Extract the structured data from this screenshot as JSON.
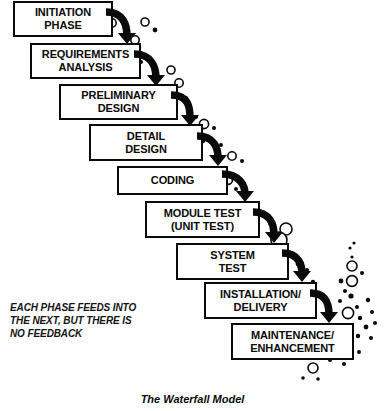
{
  "diagram": {
    "title": "The Waterfall Model",
    "caption": [
      "EACH PHASE FEEDS INTO",
      "THE NEXT, BUT THERE IS",
      "NO FEEDBACK"
    ],
    "ink_color": "#0a0a0a",
    "background_color": "#ffffff",
    "phases": [
      {
        "id": "initiation",
        "lines": [
          "INITIATION",
          "PHASE"
        ],
        "x": 13,
        "y": 1,
        "w": 100,
        "h": 36
      },
      {
        "id": "requirements",
        "lines": [
          "REQUIREMENTS",
          "ANALYSIS"
        ],
        "x": 30,
        "y": 43,
        "w": 111,
        "h": 36
      },
      {
        "id": "preliminary",
        "lines": [
          "PRELIMINARY",
          "DESIGN"
        ],
        "x": 59,
        "y": 84,
        "w": 119,
        "h": 36
      },
      {
        "id": "detail",
        "lines": [
          "DETAIL",
          "DESIGN"
        ],
        "x": 89,
        "y": 124,
        "w": 114,
        "h": 37
      },
      {
        "id": "coding",
        "lines": [
          "CODING"
        ],
        "x": 117,
        "y": 166,
        "w": 111,
        "h": 29
      },
      {
        "id": "module-test",
        "lines": [
          "MODULE TEST",
          "(UNIT TEST)"
        ],
        "x": 145,
        "y": 201,
        "w": 115,
        "h": 37
      },
      {
        "id": "system-test",
        "lines": [
          "SYSTEM",
          "TEST"
        ],
        "x": 176,
        "y": 243,
        "w": 113,
        "h": 37
      },
      {
        "id": "installation",
        "lines": [
          "INSTALLATION/",
          "DELIVERY"
        ],
        "x": 204,
        "y": 282,
        "w": 113,
        "h": 37
      },
      {
        "id": "maintenance",
        "lines": [
          "MAINTENANCE/",
          "ENHANCEMENT"
        ],
        "x": 231,
        "y": 323,
        "w": 123,
        "h": 37
      }
    ],
    "arrows": [
      {
        "id": "arrow-initiation-to-requirements",
        "path": "M 106 12 C 124 12 127 26 127 36",
        "tip_x": 127,
        "tip_y": 44
      },
      {
        "id": "arrow-requirements-to-preliminary",
        "path": "M 134 54 C 152 54 156 68 156 78",
        "tip_x": 156,
        "tip_y": 86
      },
      {
        "id": "arrow-preliminary-to-detail",
        "path": "M 171 95 C 189 95 190 108 190 118",
        "tip_x": 190,
        "tip_y": 126
      },
      {
        "id": "arrow-detail-to-coding",
        "path": "M 197 136 C 215 136 218 149 218 158",
        "tip_x": 218,
        "tip_y": 166
      },
      {
        "id": "arrow-coding-to-module-test",
        "path": "M 222 174 C 240 174 245 186 245 194",
        "tip_x": 245,
        "tip_y": 202
      },
      {
        "id": "arrow-module-test-to-system-test",
        "path": "M 253 212 C 271 212 274 226 274 235",
        "tip_x": 274,
        "tip_y": 243
      },
      {
        "id": "arrow-system-test-to-installation",
        "path": "M 282 253 C 300 253 302 266 302 274",
        "tip_x": 302,
        "tip_y": 282
      },
      {
        "id": "arrow-installation-to-maintenance",
        "path": "M 310 293 C 328 293 329 307 329 315",
        "tip_x": 329,
        "tip_y": 323
      }
    ],
    "bubbles": [
      {
        "cx": 112,
        "cy": 23,
        "r": 4.2,
        "filled": false
      },
      {
        "cx": 145,
        "cy": 22,
        "r": 4.0,
        "filled": false
      },
      {
        "cx": 155,
        "cy": 30,
        "r": 2.4,
        "filled": true
      },
      {
        "cx": 135,
        "cy": 40,
        "r": 4.2,
        "filled": false
      },
      {
        "cx": 141,
        "cy": 62,
        "r": 2.0,
        "filled": true
      },
      {
        "cx": 171,
        "cy": 70,
        "r": 4.0,
        "filled": false
      },
      {
        "cx": 179,
        "cy": 83,
        "r": 4.2,
        "filled": false
      },
      {
        "cx": 186,
        "cy": 98,
        "r": 2.0,
        "filled": true
      },
      {
        "cx": 174,
        "cy": 111,
        "r": 2.2,
        "filled": true
      },
      {
        "cx": 196,
        "cy": 117,
        "r": 2.0,
        "filled": true
      },
      {
        "cx": 204,
        "cy": 124,
        "r": 4.6,
        "filled": false
      },
      {
        "cx": 214,
        "cy": 128,
        "r": 2.0,
        "filled": true
      },
      {
        "cx": 203,
        "cy": 141,
        "r": 2.2,
        "filled": true
      },
      {
        "cx": 221,
        "cy": 145,
        "r": 2.0,
        "filled": true
      },
      {
        "cx": 232,
        "cy": 156,
        "r": 4.2,
        "filled": false
      },
      {
        "cx": 242,
        "cy": 161,
        "r": 2.0,
        "filled": true
      },
      {
        "cx": 228,
        "cy": 180,
        "r": 4.4,
        "filled": false
      },
      {
        "cx": 236,
        "cy": 189,
        "r": 2.0,
        "filled": true
      },
      {
        "cx": 258,
        "cy": 224,
        "r": 2.2,
        "filled": true
      },
      {
        "cx": 286,
        "cy": 229,
        "r": 6.0,
        "filled": false
      },
      {
        "cx": 279,
        "cy": 240,
        "r": 8.0,
        "filled": false
      },
      {
        "cx": 298,
        "cy": 264,
        "r": 2.4,
        "filled": true
      },
      {
        "cx": 307,
        "cy": 270,
        "r": 2.0,
        "filled": true
      },
      {
        "cx": 300,
        "cy": 289,
        "r": 5.4,
        "filled": false
      },
      {
        "cx": 313,
        "cy": 282,
        "r": 2.2,
        "filled": true
      },
      {
        "cx": 354,
        "cy": 243,
        "r": 1.6,
        "filled": true
      },
      {
        "cx": 350,
        "cy": 248,
        "r": 1.6,
        "filled": true
      },
      {
        "cx": 352,
        "cy": 257,
        "r": 1.6,
        "filled": true
      },
      {
        "cx": 352,
        "cy": 266,
        "r": 5.0,
        "filled": false
      },
      {
        "cx": 362,
        "cy": 273,
        "r": 2.0,
        "filled": true
      },
      {
        "cx": 352,
        "cy": 281,
        "r": 5.4,
        "filled": false
      },
      {
        "cx": 341,
        "cy": 281,
        "r": 2.4,
        "filled": true
      },
      {
        "cx": 345,
        "cy": 291,
        "r": 2.0,
        "filled": true
      },
      {
        "cx": 351,
        "cy": 296,
        "r": 2.6,
        "filled": true
      },
      {
        "cx": 340,
        "cy": 301,
        "r": 2.0,
        "filled": true
      },
      {
        "cx": 357,
        "cy": 307,
        "r": 2.0,
        "filled": true
      },
      {
        "cx": 368,
        "cy": 300,
        "r": 2.2,
        "filled": true
      },
      {
        "cx": 348,
        "cy": 313,
        "r": 5.6,
        "filled": false
      },
      {
        "cx": 360,
        "cy": 318,
        "r": 2.2,
        "filled": true
      },
      {
        "cx": 372,
        "cy": 312,
        "r": 2.0,
        "filled": true
      },
      {
        "cx": 338,
        "cy": 325,
        "r": 2.0,
        "filled": true
      },
      {
        "cx": 366,
        "cy": 327,
        "r": 2.4,
        "filled": true
      },
      {
        "cx": 375,
        "cy": 323,
        "r": 2.0,
        "filled": true
      },
      {
        "cx": 358,
        "cy": 336,
        "r": 2.2,
        "filled": true
      },
      {
        "cx": 371,
        "cy": 338,
        "r": 2.0,
        "filled": true
      },
      {
        "cx": 333,
        "cy": 343,
        "r": 5.2,
        "filled": false
      },
      {
        "cx": 348,
        "cy": 347,
        "r": 2.2,
        "filled": true
      },
      {
        "cx": 359,
        "cy": 352,
        "r": 2.0,
        "filled": true
      },
      {
        "cx": 330,
        "cy": 360,
        "r": 2.0,
        "filled": true
      },
      {
        "cx": 344,
        "cy": 364,
        "r": 2.0,
        "filled": true
      },
      {
        "cx": 313,
        "cy": 368,
        "r": 5.0,
        "filled": false
      },
      {
        "cx": 318,
        "cy": 379,
        "r": 1.8,
        "filled": true
      },
      {
        "cx": 303,
        "cy": 378,
        "r": 1.8,
        "filled": true
      }
    ]
  }
}
